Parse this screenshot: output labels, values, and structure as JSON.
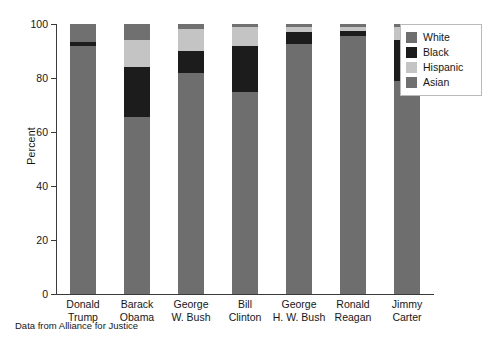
{
  "chart_data": {
    "type": "bar",
    "stacked": true,
    "title": "",
    "xlabel": "",
    "ylabel": "Percent",
    "ylim": [
      0,
      100
    ],
    "yticks": [
      0,
      20,
      40,
      60,
      80,
      100
    ],
    "ytick_labels": [
      "0",
      "20",
      "40",
      "60",
      "80",
      "100"
    ],
    "grid": false,
    "legend_position": "top-right",
    "categories": [
      "Donald Trump",
      "Barack Obama",
      "George W. Bush",
      "Bill Clinton",
      "George H. W. Bush",
      "Ronald Reagan",
      "Jimmy Carter"
    ],
    "category_lines": [
      [
        "Donald",
        "Trump"
      ],
      [
        "Barack",
        "Obama"
      ],
      [
        "George",
        "W. Bush"
      ],
      [
        "Bill",
        "Clinton"
      ],
      [
        "George",
        "H. W. Bush"
      ],
      [
        "Ronald",
        "Reagan"
      ],
      [
        "Jimmy",
        "Carter"
      ]
    ],
    "series": [
      {
        "name": "White",
        "color": "#6e6e6e",
        "values": [
          92.0,
          65.5,
          82.0,
          75.0,
          92.5,
          95.5,
          79.0
        ]
      },
      {
        "name": "Black",
        "color": "#1c1c1c",
        "values": [
          1.5,
          18.5,
          8.0,
          17.0,
          4.5,
          2.0,
          15.0
        ]
      },
      {
        "name": "Hispanic",
        "color": "#c4c4c4",
        "values": [
          0.0,
          10.0,
          8.0,
          7.0,
          2.0,
          1.5,
          5.0
        ]
      },
      {
        "name": "Asian",
        "color": "#707070",
        "values": [
          6.5,
          6.0,
          2.0,
          1.0,
          1.0,
          1.0,
          1.0
        ]
      }
    ],
    "footnote": "Data from Alliance for Justice"
  },
  "legend": {
    "items": [
      {
        "label": "White"
      },
      {
        "label": "Black"
      },
      {
        "label": "Hispanic"
      },
      {
        "label": "Asian"
      }
    ]
  }
}
